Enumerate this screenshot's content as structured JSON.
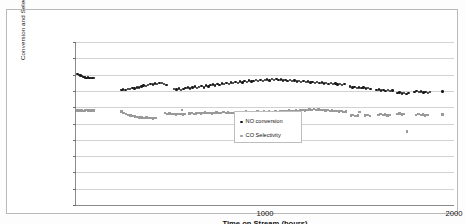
{
  "chart_data": {
    "type": "scatter",
    "title": "",
    "xlabel": "Time on Stream (hours)",
    "ylabel": "Conversion and Selectivity (%",
    "xlim": [
      0,
      2000
    ],
    "ylim": [
      0,
      100
    ],
    "xticks": [
      1000,
      2000
    ],
    "xtick_labels": [
      "1000",
      "2000"
    ],
    "yticks": [
      0,
      10,
      20,
      30,
      40,
      50,
      60,
      70,
      80,
      90,
      100
    ],
    "ytick_labels": [
      "0.00",
      "10.00",
      "20.00",
      "30.00",
      "40.00",
      "50.00",
      "60.00",
      "70.00",
      "80.00",
      "90.00",
      "100.00"
    ],
    "grid": true,
    "grid_axis": "y",
    "legend_position": "center",
    "colors": {
      "series0": "#1b1b1b",
      "series1": "#9a9a9a",
      "grid": "#d2d2d2",
      "axis": "#8a8a8a"
    },
    "series": [
      {
        "name": "NO conversion",
        "marker": "circle",
        "color": "#1b1b1b",
        "points": [
          [
            8,
            80.2
          ],
          [
            16,
            79.8
          ],
          [
            24,
            79.4
          ],
          [
            32,
            79.0
          ],
          [
            40,
            78.6
          ],
          [
            48,
            78.3
          ],
          [
            56,
            78.0
          ],
          [
            64,
            78.2
          ],
          [
            72,
            78.1
          ],
          [
            80,
            78.0
          ],
          [
            88,
            78.1
          ],
          [
            96,
            78.0
          ],
          [
            240,
            70.4
          ],
          [
            250,
            70.9
          ],
          [
            262,
            70.6
          ],
          [
            274,
            71.3
          ],
          [
            286,
            71.0
          ],
          [
            298,
            71.8
          ],
          [
            310,
            71.4
          ],
          [
            322,
            72.2
          ],
          [
            334,
            72.0
          ],
          [
            346,
            72.6
          ],
          [
            358,
            73.4
          ],
          [
            370,
            73.0
          ],
          [
            382,
            73.8
          ],
          [
            394,
            74.2
          ],
          [
            406,
            74.0
          ],
          [
            418,
            74.6
          ],
          [
            430,
            74.3
          ],
          [
            442,
            75.0
          ],
          [
            454,
            74.8
          ],
          [
            466,
            74.4
          ],
          [
            478,
            73.6
          ],
          [
            520,
            71.2
          ],
          [
            532,
            70.8
          ],
          [
            544,
            71.4
          ],
          [
            556,
            70.6
          ],
          [
            568,
            71.0
          ],
          [
            580,
            71.6
          ],
          [
            592,
            72.2
          ],
          [
            604,
            71.4
          ],
          [
            616,
            72.0
          ],
          [
            628,
            72.8
          ],
          [
            640,
            71.6
          ],
          [
            652,
            72.4
          ],
          [
            664,
            73.0
          ],
          [
            676,
            72.2
          ],
          [
            688,
            73.4
          ],
          [
            700,
            72.8
          ],
          [
            712,
            73.6
          ],
          [
            724,
            74.0
          ],
          [
            736,
            73.2
          ],
          [
            748,
            74.4
          ],
          [
            760,
            73.8
          ],
          [
            772,
            74.6
          ],
          [
            784,
            74.2
          ],
          [
            796,
            75.0
          ],
          [
            808,
            74.4
          ],
          [
            820,
            75.2
          ],
          [
            832,
            74.8
          ],
          [
            844,
            75.4
          ],
          [
            856,
            75.0
          ],
          [
            868,
            75.8
          ],
          [
            880,
            75.2
          ],
          [
            892,
            76.0
          ],
          [
            904,
            75.6
          ],
          [
            916,
            76.4
          ],
          [
            928,
            75.8
          ],
          [
            940,
            76.2
          ],
          [
            952,
            76.6
          ],
          [
            964,
            76.0
          ],
          [
            976,
            76.8
          ],
          [
            988,
            76.2
          ],
          [
            1000,
            76.6
          ],
          [
            1012,
            77.0
          ],
          [
            1024,
            76.4
          ],
          [
            1036,
            77.2
          ],
          [
            1048,
            76.8
          ],
          [
            1060,
            77.4
          ],
          [
            1072,
            76.6
          ],
          [
            1084,
            77.0
          ],
          [
            1096,
            76.4
          ],
          [
            1108,
            76.8
          ],
          [
            1120,
            76.2
          ],
          [
            1132,
            76.6
          ],
          [
            1144,
            76.0
          ],
          [
            1156,
            76.4
          ],
          [
            1168,
            75.8
          ],
          [
            1180,
            76.2
          ],
          [
            1192,
            75.6
          ],
          [
            1204,
            76.0
          ],
          [
            1216,
            75.4
          ],
          [
            1228,
            75.8
          ],
          [
            1240,
            75.2
          ],
          [
            1252,
            75.6
          ],
          [
            1264,
            75.0
          ],
          [
            1276,
            75.4
          ],
          [
            1288,
            74.8
          ],
          [
            1300,
            75.2
          ],
          [
            1312,
            74.6
          ],
          [
            1324,
            75.0
          ],
          [
            1336,
            74.4
          ],
          [
            1348,
            74.8
          ],
          [
            1360,
            74.2
          ],
          [
            1372,
            74.6
          ],
          [
            1384,
            74.0
          ],
          [
            1396,
            74.4
          ],
          [
            1408,
            73.8
          ],
          [
            1420,
            74.2
          ],
          [
            1450,
            72.6
          ],
          [
            1462,
            72.0
          ],
          [
            1474,
            72.4
          ],
          [
            1486,
            71.8
          ],
          [
            1498,
            72.2
          ],
          [
            1510,
            71.6
          ],
          [
            1522,
            72.0
          ],
          [
            1534,
            71.4
          ],
          [
            1546,
            71.8
          ],
          [
            1558,
            71.2
          ],
          [
            1590,
            70.4
          ],
          [
            1602,
            70.8
          ],
          [
            1614,
            70.2
          ],
          [
            1626,
            70.6
          ],
          [
            1638,
            70.0
          ],
          [
            1650,
            70.4
          ],
          [
            1662,
            69.8
          ],
          [
            1674,
            70.2
          ],
          [
            1700,
            68.6
          ],
          [
            1712,
            69.0
          ],
          [
            1724,
            68.4
          ],
          [
            1736,
            68.8
          ],
          [
            1748,
            68.2
          ],
          [
            1760,
            68.6
          ],
          [
            1790,
            69.4
          ],
          [
            1802,
            69.8
          ],
          [
            1814,
            69.2
          ],
          [
            1826,
            69.6
          ],
          [
            1838,
            69.0
          ],
          [
            1850,
            69.4
          ],
          [
            1862,
            68.8
          ],
          [
            1874,
            69.2
          ],
          [
            1940,
            69.6
          ]
        ]
      },
      {
        "name": "CO Selectivity",
        "marker": "square",
        "color": "#9a9a9a",
        "points": [
          [
            8,
            58.0
          ],
          [
            16,
            58.2
          ],
          [
            24,
            57.9
          ],
          [
            32,
            58.1
          ],
          [
            40,
            57.8
          ],
          [
            48,
            58.0
          ],
          [
            56,
            58.2
          ],
          [
            64,
            57.9
          ],
          [
            72,
            58.1
          ],
          [
            80,
            57.8
          ],
          [
            88,
            58.0
          ],
          [
            96,
            57.9
          ],
          [
            240,
            57.4
          ],
          [
            252,
            56.6
          ],
          [
            264,
            56.0
          ],
          [
            276,
            55.4
          ],
          [
            288,
            55.0
          ],
          [
            300,
            54.6
          ],
          [
            312,
            54.2
          ],
          [
            324,
            54.0
          ],
          [
            336,
            53.6
          ],
          [
            348,
            53.8
          ],
          [
            360,
            53.4
          ],
          [
            372,
            53.6
          ],
          [
            384,
            53.2
          ],
          [
            396,
            53.4
          ],
          [
            408,
            53.0
          ],
          [
            420,
            53.2
          ],
          [
            470,
            56.4
          ],
          [
            482,
            56.0
          ],
          [
            494,
            56.2
          ],
          [
            506,
            55.8
          ],
          [
            518,
            56.0
          ],
          [
            530,
            55.6
          ],
          [
            542,
            55.8
          ],
          [
            554,
            56.0
          ],
          [
            566,
            55.6
          ],
          [
            578,
            55.8
          ],
          [
            560,
            58.4
          ],
          [
            600,
            56.2
          ],
          [
            612,
            56.4
          ],
          [
            624,
            56.0
          ],
          [
            636,
            56.2
          ],
          [
            648,
            56.6
          ],
          [
            660,
            56.2
          ],
          [
            672,
            56.4
          ],
          [
            684,
            56.8
          ],
          [
            696,
            56.4
          ],
          [
            708,
            56.6
          ],
          [
            720,
            56.2
          ],
          [
            732,
            56.4
          ],
          [
            744,
            56.8
          ],
          [
            756,
            56.4
          ],
          [
            768,
            56.6
          ],
          [
            780,
            57.0
          ],
          [
            792,
            56.6
          ],
          [
            804,
            56.8
          ],
          [
            816,
            56.4
          ],
          [
            828,
            56.6
          ],
          [
            840,
            57.0
          ],
          [
            852,
            56.8
          ],
          [
            864,
            57.2
          ],
          [
            876,
            56.8
          ],
          [
            888,
            57.0
          ],
          [
            900,
            57.4
          ],
          [
            912,
            57.0
          ],
          [
            924,
            57.2
          ],
          [
            936,
            56.8
          ],
          [
            948,
            57.0
          ],
          [
            960,
            57.4
          ],
          [
            972,
            57.0
          ],
          [
            984,
            57.2
          ],
          [
            996,
            57.6
          ],
          [
            1008,
            57.2
          ],
          [
            1020,
            57.4
          ],
          [
            1032,
            57.0
          ],
          [
            1044,
            57.2
          ],
          [
            1056,
            57.6
          ],
          [
            1068,
            57.2
          ],
          [
            1080,
            57.4
          ],
          [
            1092,
            57.8
          ],
          [
            1104,
            57.4
          ],
          [
            1116,
            57.6
          ],
          [
            1128,
            58.0
          ],
          [
            1140,
            57.6
          ],
          [
            1152,
            57.8
          ],
          [
            1164,
            58.2
          ],
          [
            1176,
            57.8
          ],
          [
            1188,
            58.0
          ],
          [
            1200,
            58.4
          ],
          [
            1212,
            58.0
          ],
          [
            1224,
            58.2
          ],
          [
            1236,
            58.6
          ],
          [
            1248,
            58.2
          ],
          [
            1260,
            58.8
          ],
          [
            1272,
            58.4
          ],
          [
            1284,
            58.6
          ],
          [
            1296,
            58.2
          ],
          [
            1308,
            58.4
          ],
          [
            1320,
            58.0
          ],
          [
            1332,
            58.2
          ],
          [
            1344,
            57.8
          ],
          [
            1356,
            58.0
          ],
          [
            1368,
            57.6
          ],
          [
            1380,
            57.8
          ],
          [
            1392,
            57.4
          ],
          [
            1404,
            57.6
          ],
          [
            1416,
            57.2
          ],
          [
            1428,
            57.4
          ],
          [
            1455,
            54.8
          ],
          [
            1467,
            55.2
          ],
          [
            1479,
            54.6
          ],
          [
            1491,
            55.0
          ],
          [
            1500,
            57.2
          ],
          [
            1530,
            54.8
          ],
          [
            1542,
            55.2
          ],
          [
            1554,
            54.6
          ],
          [
            1600,
            55.4
          ],
          [
            1612,
            55.8
          ],
          [
            1624,
            55.2
          ],
          [
            1636,
            55.6
          ],
          [
            1648,
            55.0
          ],
          [
            1660,
            55.4
          ],
          [
            1700,
            55.8
          ],
          [
            1712,
            56.2
          ],
          [
            1724,
            55.6
          ],
          [
            1736,
            56.0
          ],
          [
            1750,
            45.2
          ],
          [
            1800,
            55.4
          ],
          [
            1812,
            55.8
          ],
          [
            1824,
            55.2
          ],
          [
            1836,
            55.6
          ],
          [
            1848,
            55.0
          ],
          [
            1860,
            55.4
          ],
          [
            1940,
            55.6
          ]
        ]
      }
    ]
  },
  "legend": {
    "entries": [
      {
        "label": "NO conversion",
        "marker": "circle",
        "color": "#1b1b1b"
      },
      {
        "label": "CO Selectivity",
        "marker": "square",
        "color": "#9a9a9a"
      }
    ]
  }
}
